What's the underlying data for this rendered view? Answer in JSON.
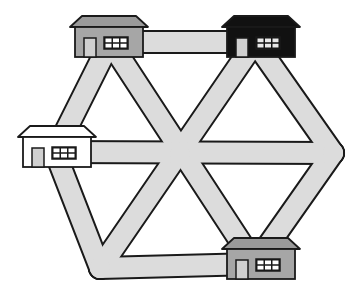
{
  "diagram": {
    "colors": {
      "background": "#ffffff",
      "road_fill": "#dcdcdc",
      "outline": "#1a1a1a",
      "house_gray_wall": "#a6a6a6",
      "house_gray_roof": "#9a9a9a",
      "house_black": "#111111",
      "house_white": "#ffffff",
      "door_fill": "#d0d0d0",
      "window_fill": "#ffffff"
    },
    "nodes": [
      {
        "id": "top-left",
        "x": 110,
        "y": 42
      },
      {
        "id": "top-right",
        "x": 255,
        "y": 42
      },
      {
        "id": "right",
        "x": 333,
        "y": 153
      },
      {
        "id": "bottom-right",
        "x": 255,
        "y": 264
      },
      {
        "id": "bottom-left",
        "x": 100,
        "y": 268
      },
      {
        "id": "left",
        "x": 55,
        "y": 152
      },
      {
        "id": "center",
        "x": 180,
        "y": 155
      }
    ],
    "roads": [
      {
        "from": "top-left",
        "to": "top-right"
      },
      {
        "from": "top-right",
        "to": "right"
      },
      {
        "from": "right",
        "to": "bottom-right"
      },
      {
        "from": "bottom-right",
        "to": "bottom-left"
      },
      {
        "from": "bottom-left",
        "to": "left"
      },
      {
        "from": "left",
        "to": "top-left"
      },
      {
        "from": "top-left",
        "to": "bottom-right"
      },
      {
        "from": "top-right",
        "to": "bottom-left"
      },
      {
        "from": "left",
        "to": "right"
      }
    ],
    "houses": [
      {
        "id": "house-top-left",
        "style": "gray",
        "x": 70,
        "y": 16
      },
      {
        "id": "house-top-right",
        "style": "black",
        "x": 222,
        "y": 16
      },
      {
        "id": "house-left",
        "style": "white",
        "x": 18,
        "y": 126
      },
      {
        "id": "house-bottom-right",
        "style": "gray",
        "x": 222,
        "y": 238
      }
    ]
  }
}
